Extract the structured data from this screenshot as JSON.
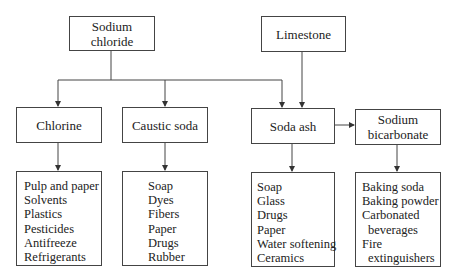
{
  "diagram": {
    "sources": [
      {
        "id": "sodium-chloride",
        "label": "Sodium chloride"
      },
      {
        "id": "limestone",
        "label": "Limestone"
      }
    ],
    "products": [
      {
        "id": "chlorine",
        "label": "Chlorine"
      },
      {
        "id": "caustic-soda",
        "label": "Caustic soda"
      },
      {
        "id": "soda-ash",
        "label": "Soda ash"
      },
      {
        "id": "sodium-bicarbonate",
        "label": "Sodium bicarbonate",
        "label_line1": "Sodium",
        "label_line2": "bicarbonate"
      }
    ],
    "uses": {
      "chlorine": [
        "Pulp and paper",
        "Solvents",
        "Plastics",
        "Pesticides",
        "Antifreeze",
        "Refrigerants"
      ],
      "caustic_soda": [
        "Soap",
        "Dyes",
        "Fibers",
        "Paper",
        "Drugs",
        "Rubber"
      ],
      "soda_ash": [
        "Soap",
        "Glass",
        "Drugs",
        "Paper",
        "Water softening",
        "Ceramics"
      ],
      "sodium_bicarbonate": [
        "Baking soda",
        "Baking powder",
        "Carbonated",
        "beverages",
        "Fire",
        "extinguishers"
      ]
    },
    "edges": [
      {
        "from": "Sodium chloride",
        "to": "Chlorine"
      },
      {
        "from": "Sodium chloride",
        "to": "Caustic soda"
      },
      {
        "from": "Sodium chloride",
        "to": "Soda ash"
      },
      {
        "from": "Limestone",
        "to": "Soda ash"
      },
      {
        "from": "Soda ash",
        "to": "Sodium bicarbonate"
      }
    ]
  }
}
